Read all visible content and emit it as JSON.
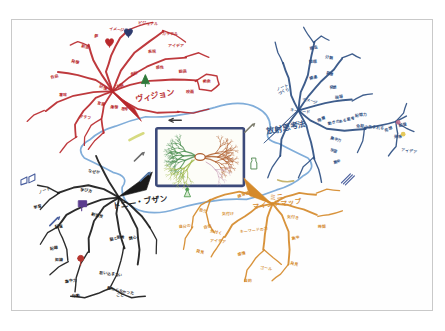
{
  "document": {
    "kind": "hand-drawn-mindmap-photo",
    "background_color": "#ffffff",
    "frame_border_color": "#c9c9c9",
    "paper_color": "#fefefe"
  },
  "center": {
    "name": "central-image-cloud",
    "shape": "cloud-bubble",
    "outline_color": "#7aa9d8",
    "inner_frame_color": "#3c4a7a",
    "drawing": "neuron / radiant tree sketch",
    "drawing_colors": [
      "#4e8f52",
      "#9fb84a",
      "#b06030",
      "#c8a0b8"
    ],
    "accent_marks": [
      "#cfd46a",
      "#7a7a7a",
      "#3f7f3f"
    ]
  },
  "branches": [
    {
      "id": "vision",
      "label": "ヴィジョン",
      "color": "#b8282c",
      "position": "top-left",
      "label_x": 155,
      "label_y": 98,
      "sub_labels": [
        {
          "text": "自由",
          "x": 54,
          "y": 77
        },
        {
          "text": "発想",
          "x": 74,
          "y": 62
        },
        {
          "text": "創造",
          "x": 84,
          "y": 47
        },
        {
          "text": "夢",
          "x": 95,
          "y": 36
        },
        {
          "text": "イメージ",
          "x": 116,
          "y": 30
        },
        {
          "text": "ビジュアル",
          "x": 148,
          "y": 24
        },
        {
          "text": "カラフル",
          "x": 170,
          "y": 34
        },
        {
          "text": "アイデア",
          "x": 176,
          "y": 46
        },
        {
          "text": "表現",
          "x": 152,
          "y": 52
        },
        {
          "text": "感性",
          "x": 160,
          "y": 68
        },
        {
          "text": "絵画",
          "x": 183,
          "y": 72
        },
        {
          "text": "美術",
          "x": 207,
          "y": 82
        },
        {
          "text": "色彩",
          "x": 134,
          "y": 74
        },
        {
          "text": "右脳",
          "x": 120,
          "y": 86
        },
        {
          "text": "記憶",
          "x": 102,
          "y": 88
        },
        {
          "text": "言語",
          "x": 100,
          "y": 105
        },
        {
          "text": "連想",
          "x": 113,
          "y": 108
        },
        {
          "text": "思考",
          "x": 124,
          "y": 110
        },
        {
          "text": "グラフ",
          "x": 84,
          "y": 118
        },
        {
          "text": "意味",
          "x": 62,
          "y": 96
        },
        {
          "text": "映画",
          "x": 190,
          "y": 92
        }
      ]
    },
    {
      "id": "radiant-thinking",
      "label": "放射思考法",
      "color": "#2e4f82",
      "position": "top-right",
      "label_x": 287,
      "label_y": 130,
      "sub_labels": [
        {
          "text": "ノート\nづくり",
          "x": 283,
          "y": 88
        },
        {
          "text": "構造",
          "x": 314,
          "y": 48
        },
        {
          "text": "整理",
          "x": 313,
          "y": 62
        },
        {
          "text": "分類",
          "x": 330,
          "y": 58
        },
        {
          "text": "発想",
          "x": 330,
          "y": 74
        },
        {
          "text": "関連",
          "x": 314,
          "y": 78
        },
        {
          "text": "発想",
          "x": 334,
          "y": 88
        },
        {
          "text": "現場",
          "x": 340,
          "y": 98
        },
        {
          "text": "キーワード",
          "x": 300,
          "y": 112
        },
        {
          "text": "イメージ",
          "x": 310,
          "y": 102
        },
        {
          "text": "階層",
          "x": 322,
          "y": 120
        },
        {
          "text": "動きのある思考",
          "x": 342,
          "y": 122
        },
        {
          "text": "記憶力",
          "x": 362,
          "y": 116
        },
        {
          "text": "会話の生まれる",
          "x": 371,
          "y": 128
        },
        {
          "text": "集中力",
          "x": 336,
          "y": 140
        },
        {
          "text": "発想",
          "x": 390,
          "y": 130
        },
        {
          "text": "記憶",
          "x": 404,
          "y": 126
        },
        {
          "text": "発想",
          "x": 399,
          "y": 138
        },
        {
          "text": "アイデア",
          "x": 410,
          "y": 152
        },
        {
          "text": "学習",
          "x": 334,
          "y": 152
        },
        {
          "text": "集中",
          "x": 338,
          "y": 163
        }
      ]
    },
    {
      "id": "tony-buzan",
      "label": "トニー・ブザン",
      "color": "#1a1a1a",
      "position": "bottom-left",
      "label_x": 140,
      "label_y": 205,
      "sub_labels": [
        {
          "text": "ノート",
          "x": 44,
          "y": 192
        },
        {
          "text": "学習",
          "x": 37,
          "y": 208
        },
        {
          "text": "記憶",
          "x": 58,
          "y": 228
        },
        {
          "text": "記録",
          "x": 53,
          "y": 250
        },
        {
          "text": "知識",
          "x": 58,
          "y": 262
        },
        {
          "text": "なぜか",
          "x": 93,
          "y": 173
        },
        {
          "text": "学び方",
          "x": 85,
          "y": 192
        },
        {
          "text": "創造性",
          "x": 96,
          "y": 217
        },
        {
          "text": "脳と思考",
          "x": 117,
          "y": 240
        },
        {
          "text": "関心",
          "x": 133,
          "y": 240
        },
        {
          "text": "集中力",
          "x": 70,
          "y": 283
        },
        {
          "text": "行動",
          "x": 75,
          "y": 298
        },
        {
          "text": "思い込まない",
          "x": 110,
          "y": 276
        },
        {
          "text": "教わらなかった\nこと",
          "x": 120,
          "y": 293
        }
      ]
    },
    {
      "id": "mini-mindmap",
      "label": "ミニ\nマインドマップ",
      "color": "#d58a2b",
      "position": "bottom-center-right",
      "label_x": 277,
      "label_y": 199,
      "sub_labels": [
        {
          "text": "練習帳",
          "x": 244,
          "y": 196
        },
        {
          "text": "自分",
          "x": 203,
          "y": 212
        },
        {
          "text": "気付け",
          "x": 228,
          "y": 215
        },
        {
          "text": "自分の",
          "x": 185,
          "y": 228
        },
        {
          "text": "自信",
          "x": 208,
          "y": 228
        },
        {
          "text": "気付く",
          "x": 216,
          "y": 234
        },
        {
          "text": "アイデア",
          "x": 218,
          "y": 243
        },
        {
          "text": "キーワードの力",
          "x": 254,
          "y": 232
        },
        {
          "text": "感情",
          "x": 242,
          "y": 256
        },
        {
          "text": "発見",
          "x": 200,
          "y": 254
        },
        {
          "text": "気付き",
          "x": 293,
          "y": 219
        },
        {
          "text": "時間",
          "x": 322,
          "y": 228
        },
        {
          "text": "集中",
          "x": 296,
          "y": 240
        },
        {
          "text": "発見",
          "x": 294,
          "y": 266
        },
        {
          "text": "ゴール",
          "x": 266,
          "y": 270
        },
        {
          "text": "目的",
          "x": 248,
          "y": 283
        }
      ]
    }
  ],
  "icons": [
    {
      "name": "book-icon",
      "x": 27,
      "y": 178,
      "color": "#4a5f9e"
    },
    {
      "name": "pencil-icon",
      "x": 53,
      "y": 222,
      "color": "#4a5f9e"
    },
    {
      "name": "purple-box-icon",
      "x": 82,
      "y": 204,
      "color": "#5b3c8e"
    },
    {
      "name": "red-flower-icon",
      "x": 80,
      "y": 259,
      "color": "#b5352f"
    },
    {
      "name": "heart-icon",
      "x": 128,
      "y": 32,
      "color": "#2e3b6e"
    },
    {
      "name": "small-heart-icon",
      "x": 109,
      "y": 42,
      "color": "#b8282c"
    },
    {
      "name": "green-tree-icon",
      "x": 145,
      "y": 78,
      "color": "#2f7a3a"
    },
    {
      "name": "green-person-icon",
      "x": 187,
      "y": 192,
      "color": "#4e9a4e"
    },
    {
      "name": "brush-icon",
      "x": 249,
      "y": 128,
      "color": "#7a7a6a"
    },
    {
      "name": "bottle-icon",
      "x": 254,
      "y": 163,
      "color": "#5b8f5b"
    },
    {
      "name": "pen-icon",
      "x": 138,
      "y": 157,
      "color": "#6a6a6a"
    },
    {
      "name": "marker-icon",
      "x": 144,
      "y": 177,
      "color": "#4a6f9e"
    },
    {
      "name": "arrow-icon",
      "x": 175,
      "y": 120,
      "color": "#3a3a3a"
    },
    {
      "name": "pencils-icon",
      "x": 347,
      "y": 178,
      "color": "#4a5f9e"
    },
    {
      "name": "yellow-dot-icon",
      "x": 404,
      "y": 134,
      "color": "#e0c040"
    },
    {
      "name": "pink-dot-icon",
      "x": 399,
      "y": 122,
      "color": "#c06a8a"
    }
  ]
}
